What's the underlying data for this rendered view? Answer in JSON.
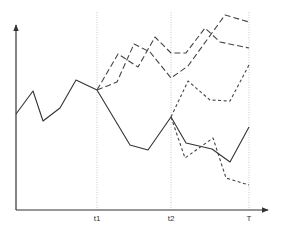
{
  "chart_data": {
    "type": "line",
    "title": "",
    "xlabel": "",
    "ylabel": "",
    "grid": false,
    "x_ticks": [
      {
        "label": "t1",
        "x": 97
      },
      {
        "label": "t2",
        "x": 171
      },
      {
        "label": "T",
        "x": 249
      }
    ],
    "axes": {
      "origin": [
        16,
        210
      ],
      "x_end": [
        268,
        210
      ],
      "y_end": [
        16,
        25
      ],
      "color": "#333333"
    },
    "series": [
      {
        "name": "realized-path",
        "style": "solid",
        "color": "#333333",
        "points": [
          [
            16,
            114
          ],
          [
            33,
            91
          ],
          [
            43,
            121
          ],
          [
            60,
            108
          ],
          [
            76,
            80
          ],
          [
            97,
            90
          ],
          [
            130,
            145
          ],
          [
            148,
            150
          ],
          [
            171,
            117
          ],
          [
            186,
            143
          ],
          [
            212,
            149
          ],
          [
            230,
            162
          ],
          [
            249,
            127
          ]
        ]
      },
      {
        "name": "scenario-t1-a",
        "style": "long-dash",
        "color": "#444444",
        "points": [
          [
            97,
            90
          ],
          [
            118,
            54
          ],
          [
            138,
            67
          ],
          [
            155,
            37
          ],
          [
            171,
            53
          ],
          [
            186,
            53
          ],
          [
            205,
            28
          ],
          [
            220,
            42
          ],
          [
            249,
            48
          ]
        ]
      },
      {
        "name": "scenario-t1-b",
        "style": "long-dash",
        "color": "#444444",
        "points": [
          [
            97,
            90
          ],
          [
            117,
            82
          ],
          [
            134,
            44
          ],
          [
            150,
            52
          ],
          [
            171,
            78
          ],
          [
            188,
            66
          ],
          [
            225,
            15
          ],
          [
            249,
            22
          ]
        ]
      },
      {
        "name": "scenario-t2-a",
        "style": "short-dash",
        "color": "#444444",
        "points": [
          [
            171,
            117
          ],
          [
            188,
            81
          ],
          [
            210,
            100
          ],
          [
            230,
            101
          ],
          [
            249,
            65
          ]
        ]
      },
      {
        "name": "scenario-t2-b",
        "style": "short-dash",
        "color": "#444444",
        "points": [
          [
            171,
            117
          ],
          [
            185,
            158
          ],
          [
            213,
            138
          ],
          [
            226,
            178
          ],
          [
            249,
            185
          ]
        ]
      }
    ]
  }
}
